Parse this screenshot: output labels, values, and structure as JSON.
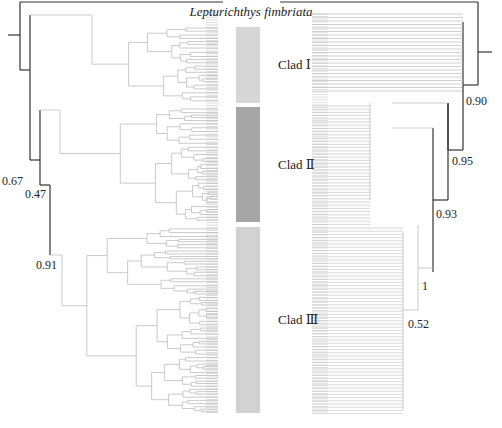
{
  "figure": {
    "title": "Lepturichthys fimbriata",
    "type": "mirrored phylogenetic trees with clade bars"
  },
  "clades": [
    {
      "label": "Clad Ⅰ",
      "color": "#d6d6d6",
      "top": 27,
      "bottom": 103
    },
    {
      "label": "Clad Ⅱ",
      "color": "#a6a6a6",
      "top": 107,
      "bottom": 222
    },
    {
      "label": "Clad Ⅲ",
      "color": "#d2d2d2",
      "top": 227,
      "bottom": 413
    }
  ],
  "left_tree": {
    "support_values": [
      {
        "value": "0.67",
        "x": 2,
        "y": 175
      },
      {
        "value": "0.47",
        "x": 25,
        "y": 188
      },
      {
        "value": "0.91",
        "x": 36,
        "y": 259
      }
    ]
  },
  "right_tree": {
    "support_values": [
      {
        "value": "0.90",
        "x": 466,
        "y": 95
      },
      {
        "value": "0.95",
        "x": 452,
        "y": 155
      },
      {
        "value": "0.93",
        "x": 436,
        "y": 208
      },
      {
        "value": "1",
        "x": 422,
        "y": 280
      },
      {
        "value": "0.52",
        "x": 408,
        "y": 318
      }
    ]
  },
  "colors": {
    "backbone": "#333333",
    "branch": "#bdbdbd",
    "text": "#222222"
  }
}
